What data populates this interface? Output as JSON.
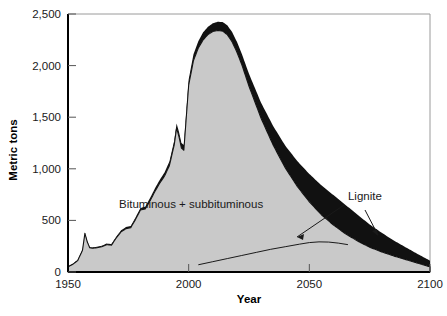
{
  "chart_data": {
    "type": "area",
    "title": "",
    "subtitle": "",
    "xlabel": "Year",
    "ylabel": "Metric tons",
    "xlim": [
      1950,
      2100
    ],
    "ylim": [
      0,
      2500
    ],
    "grid": false,
    "legend_position": "inline-annotations",
    "stacked": true,
    "x_ticks": [
      "1950",
      "2000",
      "2050",
      "2100"
    ],
    "x_tick_values": [
      1950,
      2000,
      2050,
      2100
    ],
    "y_ticks": [
      "0",
      "500",
      "1,000",
      "1,500",
      "2,000",
      "2,500"
    ],
    "y_tick_values": [
      0,
      500,
      1000,
      1500,
      2000,
      2500
    ],
    "colors": {
      "bituminous_fill": "#c9c9c9",
      "lignite_fill": "#111111",
      "outline": "#111111",
      "axis": "#000000",
      "frame": "#9a9a9a",
      "text": "#1a1a1a"
    },
    "annotations": [
      {
        "name": "bituminous-label",
        "text": "Bituminous + subbituminous",
        "x": 2001,
        "y": 620
      },
      {
        "name": "lignite-label",
        "text": "Lignite",
        "x": 2066,
        "y": 700
      }
    ],
    "series": [
      {
        "name": "Bituminous + subbituminous",
        "color": "#c9c9c9",
        "x": [
          1950,
          1952,
          1954,
          1956,
          1957,
          1958,
          1959,
          1960,
          1962,
          1964,
          1966,
          1968,
          1970,
          1972,
          1974,
          1976,
          1978,
          1980,
          1982,
          1984,
          1986,
          1988,
          1990,
          1992,
          1994,
          1995,
          1996,
          1997,
          1998,
          2000,
          2002,
          2004,
          2006,
          2008,
          2010,
          2012,
          2014,
          2016,
          2018,
          2020,
          2022,
          2025,
          2030,
          2035,
          2040,
          2045,
          2050,
          2055,
          2060,
          2065,
          2070,
          2075,
          2080,
          2085,
          2090,
          2095,
          2100
        ],
        "values": [
          50,
          75,
          110,
          210,
          375,
          290,
          235,
          230,
          235,
          245,
          265,
          260,
          330,
          390,
          420,
          430,
          510,
          600,
          610,
          690,
          780,
          860,
          930,
          1030,
          1230,
          1395,
          1310,
          1200,
          1180,
          1810,
          2050,
          2170,
          2250,
          2300,
          2330,
          2340,
          2335,
          2300,
          2230,
          2130,
          2010,
          1800,
          1490,
          1230,
          1010,
          830,
          680,
          555,
          455,
          370,
          300,
          240,
          195,
          155,
          120,
          85,
          50
        ]
      },
      {
        "name": "Lignite",
        "color": "#111111",
        "x": [
          1950,
          1960,
          1970,
          1980,
          1990,
          2000,
          2005,
          2010,
          2014,
          2018,
          2022,
          2026,
          2030,
          2035,
          2040,
          2045,
          2050,
          2055,
          2060,
          2065,
          2070,
          2075,
          2080,
          2085,
          2090,
          2095,
          2100
        ],
        "values": [
          5,
          8,
          12,
          20,
          35,
          55,
          70,
          80,
          88,
          95,
          105,
          125,
          150,
          185,
          215,
          245,
          270,
          285,
          290,
          280,
          255,
          220,
          185,
          150,
          118,
          88,
          60
        ]
      }
    ],
    "lignite_guide_curve": {
      "name": "Lignite guide line",
      "x": [
        2004,
        2010,
        2016,
        2022,
        2028,
        2034,
        2040,
        2046,
        2050,
        2054,
        2058,
        2062,
        2066
      ],
      "values": [
        70,
        100,
        130,
        160,
        190,
        220,
        245,
        270,
        285,
        292,
        290,
        280,
        265
      ]
    }
  }
}
